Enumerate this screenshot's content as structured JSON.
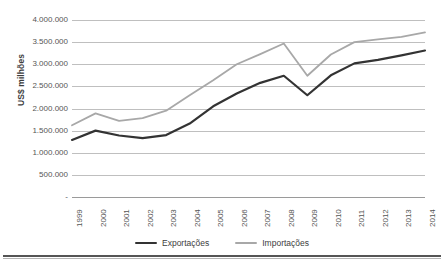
{
  "chart_data": {
    "type": "line",
    "title": "",
    "xlabel": "",
    "ylabel": "US$ milhões",
    "ylim": [
      0,
      4000000
    ],
    "grid": true,
    "legend_position": "bottom",
    "categories": [
      "1999",
      "2000",
      "2001",
      "2002",
      "2003",
      "2004",
      "2005",
      "2006",
      "2007",
      "2008",
      "2009",
      "2010",
      "2011",
      "2012",
      "2013",
      "2014"
    ],
    "y_ticks": [
      {
        "value": 4000000,
        "label": "4.000.000"
      },
      {
        "value": 3500000,
        "label": "3.500.000"
      },
      {
        "value": 3000000,
        "label": "3.000.000"
      },
      {
        "value": 2500000,
        "label": "2.500.000"
      },
      {
        "value": 2000000,
        "label": "2.000.000"
      },
      {
        "value": 1500000,
        "label": "1.500.000"
      },
      {
        "value": 1000000,
        "label": "1.000.000"
      },
      {
        "value": 500000,
        "label": "500.000"
      },
      {
        "value": 0,
        "label": "-"
      }
    ],
    "series": [
      {
        "name": "Exportações",
        "color": "#333333",
        "values": [
          1290000,
          1500000,
          1390000,
          1330000,
          1400000,
          1660000,
          2050000,
          2340000,
          2580000,
          2740000,
          2300000,
          2750000,
          3020000,
          3100000,
          3200000,
          3310000
        ]
      },
      {
        "name": "Importações",
        "color": "#a8a8a8",
        "values": [
          1620000,
          1890000,
          1720000,
          1780000,
          1950000,
          2300000,
          2640000,
          3000000,
          3230000,
          3470000,
          2740000,
          3220000,
          3500000,
          3560000,
          3620000,
          3720000
        ]
      }
    ]
  },
  "legend": {
    "items": [
      {
        "label": "Exportações",
        "color": "#333333"
      },
      {
        "label": "Importações",
        "color": "#a8a8a8"
      }
    ]
  }
}
